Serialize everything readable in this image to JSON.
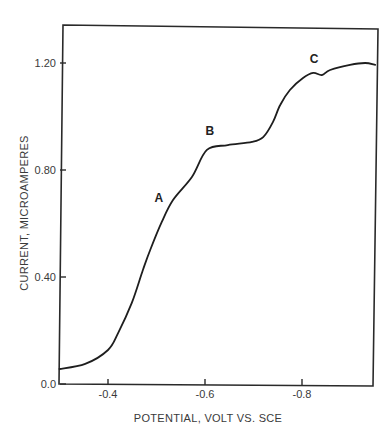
{
  "chart_data": {
    "type": "line",
    "title": "",
    "xlabel": "POTENTIAL, VOLT VS. SCE",
    "ylabel": "CURRENT, MICROAMPERES",
    "xlim": [
      -0.3,
      -0.95
    ],
    "ylim": [
      0.0,
      1.35
    ],
    "grid": false,
    "legend": null,
    "x_ticks": [
      {
        "value": -0.4,
        "label": "-0.4"
      },
      {
        "value": -0.6,
        "label": "-0.6"
      },
      {
        "value": -0.8,
        "label": "-0.8"
      }
    ],
    "y_ticks": [
      {
        "value": 0.0,
        "label": "0.0"
      },
      {
        "value": 0.4,
        "label": "0.40"
      },
      {
        "value": 0.8,
        "label": "0.80"
      },
      {
        "value": 1.2,
        "label": "1.20"
      }
    ],
    "series": [
      {
        "name": "polarogram",
        "x": [
          -0.3,
          -0.353,
          -0.4,
          -0.421,
          -0.449,
          -0.472,
          -0.487,
          -0.511,
          -0.534,
          -0.573,
          -0.604,
          -0.647,
          -0.697,
          -0.72,
          -0.74,
          -0.755,
          -0.775,
          -0.802,
          -0.823,
          -0.841,
          -0.858,
          -0.899,
          -0.93,
          -0.951
        ],
        "y": [
          0.056,
          0.075,
          0.127,
          0.191,
          0.303,
          0.426,
          0.501,
          0.606,
          0.688,
          0.774,
          0.875,
          0.893,
          0.905,
          0.923,
          0.979,
          1.043,
          1.099,
          1.144,
          1.163,
          1.155,
          1.174,
          1.193,
          1.2,
          1.193
        ]
      }
    ],
    "annotations": [
      {
        "text": "A",
        "x": -0.505,
        "y": 0.68
      },
      {
        "text": "B",
        "x": -0.61,
        "y": 0.93
      },
      {
        "text": "C",
        "x": -0.825,
        "y": 1.2
      }
    ]
  }
}
